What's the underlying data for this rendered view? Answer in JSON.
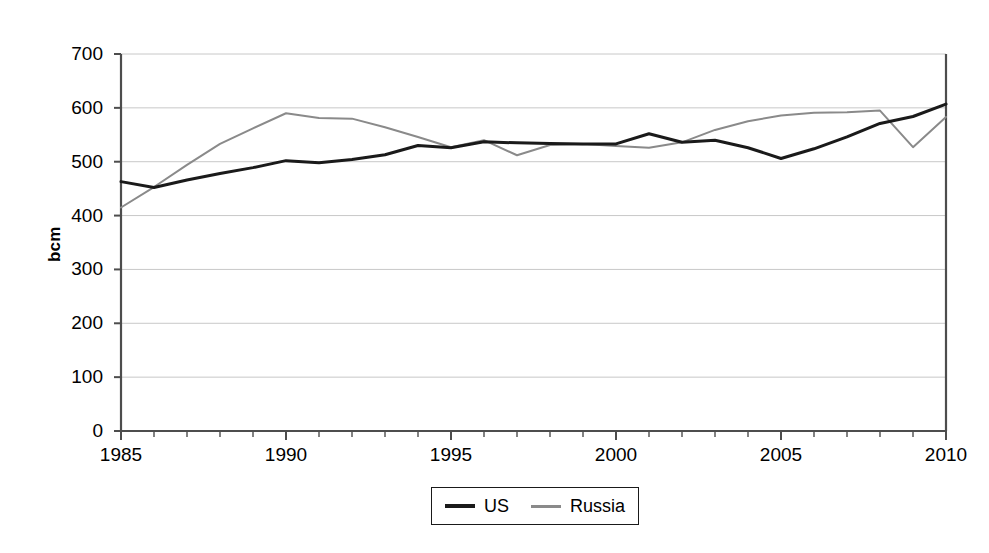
{
  "chart_data": {
    "type": "line",
    "title": "",
    "xlabel": "",
    "ylabel": "bcm",
    "xlim": [
      1985,
      2010
    ],
    "ylim": [
      0,
      700
    ],
    "ytick_step": 100,
    "yticks": [
      0,
      100,
      200,
      300,
      400,
      500,
      600,
      700
    ],
    "ytick_labels": [
      "0",
      "100",
      "200",
      "300",
      "400",
      "500",
      "600",
      "700"
    ],
    "xticks_major": [
      1985,
      1990,
      1995,
      2000,
      2005,
      2010
    ],
    "xtick_labels": [
      "1985",
      "1990",
      "1995",
      "2000",
      "2005",
      "2010"
    ],
    "xtick_minor_step": 1,
    "grid": "horizontal",
    "legend_position": "bottom-center",
    "x": [
      1985,
      1986,
      1987,
      1988,
      1989,
      1990,
      1991,
      1992,
      1993,
      1994,
      1995,
      1996,
      1997,
      1998,
      1999,
      2000,
      2001,
      2002,
      2003,
      2004,
      2005,
      2006,
      2007,
      2008,
      2009,
      2010
    ],
    "series": [
      {
        "name": "US",
        "color": "#1a1a1a",
        "line_width": 3,
        "values": [
          463,
          452,
          466,
          478,
          489,
          502,
          498,
          504,
          513,
          530,
          526,
          537,
          535,
          534,
          533,
          533,
          552,
          536,
          540,
          526,
          506,
          524,
          546,
          571,
          584,
          607
        ]
      },
      {
        "name": "Russia",
        "color": "#8a8a8a",
        "line_width": 2,
        "values": [
          415,
          453,
          494,
          533,
          562,
          590,
          581,
          580,
          564,
          546,
          527,
          540,
          512,
          531,
          533,
          529,
          526,
          536,
          559,
          575,
          586,
          591,
          592,
          595,
          527,
          583
        ]
      }
    ]
  },
  "legend": {
    "items": [
      {
        "label": "US"
      },
      {
        "label": "Russia"
      }
    ]
  },
  "colors": {
    "us": "#1a1a1a",
    "russia": "#8a8a8a",
    "axis": "#4d4d4d",
    "grid": "#c8c8c8",
    "text": "#000000"
  }
}
